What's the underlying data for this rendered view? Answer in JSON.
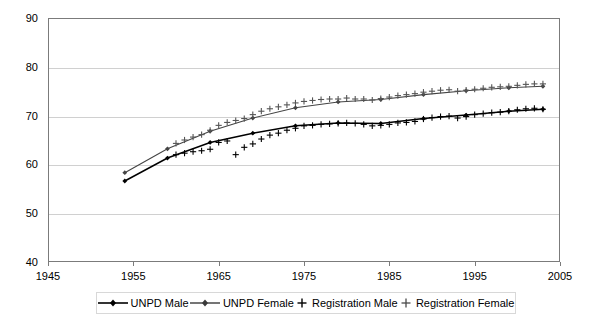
{
  "chart_data": {
    "type": "line",
    "title": "",
    "subtitle": "",
    "xlabel": "",
    "ylabel": "",
    "xlim": [
      1945,
      2005
    ],
    "ylim": [
      40,
      90
    ],
    "xticks": [
      1945,
      1955,
      1965,
      1975,
      1985,
      1995,
      2005
    ],
    "yticks": [
      40,
      50,
      60,
      70,
      80,
      90
    ],
    "grid": true,
    "legend_position": "bottom",
    "series": [
      {
        "name": "UNPD Male",
        "marker": "diamond",
        "style": "line-marker",
        "color": "#000000",
        "x": [
          1954,
          1959,
          1964,
          1969,
          1974,
          1979,
          1984,
          1989,
          1994,
          1999,
          2003
        ],
        "values": [
          56.6,
          61.3,
          64.5,
          66.4,
          67.9,
          68.5,
          68.4,
          69.4,
          70.1,
          70.9,
          71.3
        ]
      },
      {
        "name": "UNPD Female",
        "marker": "diamond",
        "style": "line-marker",
        "color": "#444444",
        "x": [
          1954,
          1959,
          1964,
          1969,
          1974,
          1979,
          1984,
          1989,
          1994,
          1999,
          2003
        ],
        "values": [
          58.3,
          63.2,
          66.8,
          69.5,
          71.6,
          72.8,
          73.3,
          74.3,
          75.1,
          75.7,
          76.0
        ]
      },
      {
        "name": "Registration Male",
        "marker": "plus",
        "style": "points",
        "color": "#000000",
        "x": [
          1960,
          1961,
          1962,
          1963,
          1964,
          1965,
          1966,
          1967,
          1968,
          1969,
          1970,
          1971,
          1972,
          1973,
          1974,
          1975,
          1976,
          1977,
          1978,
          1979,
          1980,
          1981,
          1982,
          1983,
          1984,
          1985,
          1986,
          1987,
          1988,
          1989,
          1990,
          1991,
          1992,
          1993,
          1994,
          1995,
          1996,
          1997,
          1998,
          1999,
          2000,
          2001,
          2002,
          2003
        ],
        "values": [
          62.0,
          62.3,
          62.6,
          62.8,
          63.1,
          64.5,
          64.8,
          62.0,
          63.5,
          64.2,
          65.2,
          66.0,
          66.4,
          67.0,
          67.4,
          67.9,
          68.0,
          68.2,
          68.3,
          68.4,
          68.5,
          68.4,
          68.2,
          67.9,
          68.0,
          68.2,
          68.5,
          68.6,
          68.8,
          69.3,
          69.6,
          69.8,
          69.9,
          69.5,
          69.8,
          70.2,
          70.4,
          70.6,
          70.7,
          70.9,
          71.2,
          71.4,
          71.5,
          71.3
        ]
      },
      {
        "name": "Registration Female",
        "marker": "plus",
        "style": "points",
        "color": "#555555",
        "x": [
          1960,
          1961,
          1962,
          1963,
          1964,
          1965,
          1966,
          1967,
          1968,
          1969,
          1970,
          1971,
          1972,
          1973,
          1974,
          1975,
          1976,
          1977,
          1978,
          1979,
          1980,
          1981,
          1982,
          1983,
          1984,
          1985,
          1986,
          1987,
          1988,
          1989,
          1990,
          1991,
          1992,
          1993,
          1994,
          1995,
          1996,
          1997,
          1998,
          1999,
          2000,
          2001,
          2002,
          2003
        ],
        "values": [
          64.3,
          65.0,
          65.6,
          66.1,
          67.0,
          68.0,
          68.6,
          69.0,
          69.4,
          70.2,
          70.9,
          71.4,
          71.8,
          72.2,
          72.6,
          72.9,
          73.1,
          73.3,
          73.4,
          73.4,
          73.6,
          73.4,
          73.4,
          73.2,
          73.5,
          73.8,
          74.1,
          74.3,
          74.5,
          74.8,
          75.0,
          75.2,
          75.3,
          75.0,
          75.2,
          75.4,
          75.6,
          75.8,
          75.9,
          76.0,
          76.2,
          76.4,
          76.5,
          76.5
        ]
      }
    ]
  },
  "axes": {
    "y_tick_labels": [
      "90",
      "80",
      "70",
      "60",
      "50",
      "40"
    ],
    "x_tick_labels": [
      "1945",
      "1955",
      "1965",
      "1975",
      "1985",
      "1995",
      "2005"
    ]
  },
  "legend": {
    "items": [
      {
        "label": "UNPD Male",
        "marker": "line-diamond-marker"
      },
      {
        "label": "UNPD Female",
        "marker": "line-diamond-marker"
      },
      {
        "label": "Registration Male",
        "marker": "plus-marker"
      },
      {
        "label": "Registration Female",
        "marker": "plus-marker"
      }
    ]
  }
}
